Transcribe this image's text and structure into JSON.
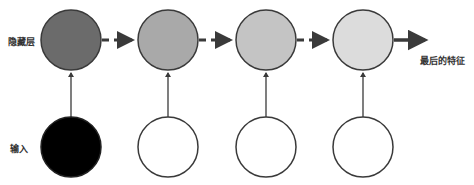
{
  "labels": {
    "hidden_layer": "隐藏层",
    "input": "输入",
    "final_feature": "最后的特征"
  },
  "colors": {
    "stroke": "#3a3a3a",
    "arrow": "#444444",
    "hidden_fills": [
      "#6b6b6b",
      "#a9a9a9",
      "#c4c4c4",
      "#dcdcdc"
    ],
    "input_fills": [
      "#000000",
      "#ffffff",
      "#ffffff",
      "#ffffff"
    ]
  },
  "nodes": {
    "hidden": [
      {
        "cx": 71,
        "cy": 40,
        "r": 30
      },
      {
        "cx": 168,
        "cy": 40,
        "r": 30
      },
      {
        "cx": 266,
        "cy": 40,
        "r": 30
      },
      {
        "cx": 363,
        "cy": 40,
        "r": 30
      }
    ],
    "input": [
      {
        "cx": 71,
        "cy": 147,
        "r": 30
      },
      {
        "cx": 168,
        "cy": 147,
        "r": 30
      },
      {
        "cx": 266,
        "cy": 147,
        "r": 30
      },
      {
        "cx": 363,
        "cy": 147,
        "r": 30
      }
    ]
  }
}
